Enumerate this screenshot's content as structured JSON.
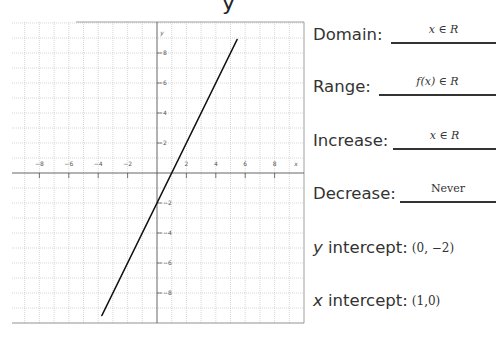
{
  "chart_data": {
    "type": "line",
    "title": "",
    "xlabel": "x",
    "ylabel": "y",
    "xlim": [
      -9.9,
      10
    ],
    "ylim": [
      -10,
      10
    ],
    "grid": true,
    "x_ticks": [
      -8,
      -6,
      -4,
      -2,
      2,
      4,
      6,
      8
    ],
    "y_ticks": [
      8,
      6,
      4,
      2,
      -2,
      -4,
      -6,
      -8
    ],
    "x_tick_labels": [
      "−8",
      "−6",
      "−4",
      "−2",
      "2",
      "4",
      "6",
      "8"
    ],
    "y_tick_labels": [
      "8",
      "6",
      "4",
      "2",
      "−2",
      "−4",
      "−6",
      "−8"
    ],
    "series": [
      {
        "name": "f(x) = 2x − 2",
        "x": [
          -3.75,
          5.45
        ],
        "y": [
          -9.5,
          8.9
        ]
      }
    ],
    "equation": "y = 2x − 2",
    "colors": {
      "line": "#111111",
      "grid": "#bdbdbd",
      "axis": "#555555"
    }
  },
  "properties": {
    "domain": {
      "label": "Domain:",
      "value": "x ∈ R"
    },
    "range": {
      "label": "Range:",
      "value": "f(x) ∈ R"
    },
    "increase": {
      "label": "Increase:",
      "value": "x ∈ R"
    },
    "decrease": {
      "label": "Decrease:",
      "value": "Never"
    },
    "y_intercept": {
      "label_var": "y",
      "label_rest": " intercept:",
      "value": "(0, −2)"
    },
    "x_intercept": {
      "label_var": "x",
      "label_rest": " intercept:",
      "value": "(1,0)"
    }
  },
  "axis_labels": {
    "x": "x",
    "y": "y"
  }
}
